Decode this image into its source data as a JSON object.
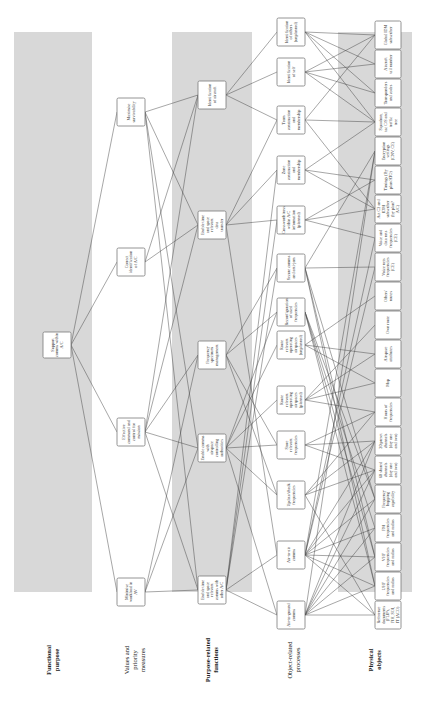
{
  "diagram": {
    "orientation": "rotated 90 degrees counter-clockwise",
    "layers": [
      {
        "id": "fp",
        "label": "Functional purpose",
        "bold": true,
        "shaded": true
      },
      {
        "id": "vpm",
        "label": "Values and priority measures",
        "bold": false,
        "shaded": false
      },
      {
        "id": "prf",
        "label": "Purpose-related functions",
        "bold": true,
        "shaded": true
      },
      {
        "id": "orp",
        "label": "Object-related processes",
        "bold": false,
        "shaded": false
      },
      {
        "id": "po",
        "label": "Physical objects",
        "bold": true,
        "shaded": true
      }
    ],
    "nodes": {
      "fp": [
        {
          "id": "fp1",
          "label": "Support comms within A/C"
        }
      ],
      "vpm": [
        {
          "id": "v1",
          "label": "Minimise workload in AV"
        },
        {
          "id": "v2",
          "label": "Effective command and control for mission"
        },
        {
          "id": "v3",
          "label": "Correct identification of A/C"
        },
        {
          "id": "v4",
          "label": "Maximise survivability"
        }
      ],
      "prf": [
        {
          "id": "p1",
          "label": "Enable time and space relevant comms with other A/C"
        },
        {
          "id": "p2",
          "label": "Enable comms with airspace controlling authorities"
        },
        {
          "id": "p3",
          "label": "Frequency spectrum management"
        },
        {
          "id": "p4",
          "label": "Enable time and space relevant data transfer"
        },
        {
          "id": "p5",
          "label": "Identification of aircraft"
        }
      ],
      "orp": [
        {
          "id": "o1",
          "label": "Air-to-ground comms"
        },
        {
          "id": "o2",
          "label": "Air-to-air comms"
        },
        {
          "id": "o3",
          "label": "Update/check frequencies"
        },
        {
          "id": "o4",
          "label": "Store relevant frequencies"
        },
        {
          "id": "o5",
          "label": "Route relevant operating airspaces (planned)"
        },
        {
          "id": "o6",
          "label": "Route relevant operating airspaces (unplanned)"
        },
        {
          "id": "o7",
          "label": "Reconfiguration of used frequencies"
        },
        {
          "id": "o8",
          "label": "Secure comms and anti-jam"
        },
        {
          "id": "o9",
          "label": "Crossworthiness within A/C information (planned)"
        },
        {
          "id": "o10",
          "label": "Zone construction and membership"
        },
        {
          "id": "o11",
          "label": "Team construction and membership"
        },
        {
          "id": "o12",
          "label": "Identification of self"
        },
        {
          "id": "o13",
          "label": "Identification of others (unplanned)"
        }
      ],
      "po": [
        {
          "id": "x1",
          "label": "Reference documents (FLIPs, FIH, SOI, IT (ACO)"
        },
        {
          "id": "x2",
          "label": "UHF frequencies and radios"
        },
        {
          "id": "x3",
          "label": "VHF frequencies and radios"
        },
        {
          "id": "x4",
          "label": "FM frequencies and radios"
        },
        {
          "id": "x5",
          "label": "Frequency hopping capability"
        },
        {
          "id": "x6",
          "label": "60 shared channels (day one and two)"
        },
        {
          "id": "x7",
          "label": "20 preset channels (day one and two)"
        },
        {
          "id": "x8",
          "label": "Hours of frequencies"
        },
        {
          "id": "x9",
          "label": "Map"
        },
        {
          "id": "x10",
          "label": "Airspace attributes"
        },
        {
          "id": "x11",
          "label": "Own route"
        },
        {
          "id": "x12",
          "label": "Others' routes"
        },
        {
          "id": "x13",
          "label": "Voice nets frequencies (CE)"
        },
        {
          "id": "x14",
          "label": "Voice and data nets frequencies (CE)"
        },
        {
          "id": "x15",
          "label": "Act C2 and IDM subscriber (by plan? A/C)"
        },
        {
          "id": "x16",
          "label": "Timings (By plan/ATO)"
        },
        {
          "id": "x17",
          "label": "Encryption settings (CNV, CE)"
        },
        {
          "id": "x18",
          "label": "Squadron, tac C/S and traffic tree"
        },
        {
          "id": "x19",
          "label": "Transponders and codes"
        },
        {
          "id": "x20",
          "label": "Aircraft tail number"
        },
        {
          "id": "x21",
          "label": "Global IDM subscriber"
        }
      ]
    },
    "edges": [
      [
        "fp1",
        "v1"
      ],
      [
        "fp1",
        "v2"
      ],
      [
        "fp1",
        "v3"
      ],
      [
        "fp1",
        "v4"
      ],
      [
        "v1",
        "p1"
      ],
      [
        "v1",
        "p2"
      ],
      [
        "v1",
        "p3"
      ],
      [
        "v2",
        "p1"
      ],
      [
        "v2",
        "p2"
      ],
      [
        "v2",
        "p3"
      ],
      [
        "v2",
        "p4"
      ],
      [
        "v2",
        "p5"
      ],
      [
        "v3",
        "p4"
      ],
      [
        "v3",
        "p5"
      ],
      [
        "v4",
        "p1"
      ],
      [
        "v4",
        "p2"
      ],
      [
        "v4",
        "p4"
      ],
      [
        "v4",
        "p5"
      ],
      [
        "p1",
        "o1"
      ],
      [
        "p1",
        "o2"
      ],
      [
        "p1",
        "o8"
      ],
      [
        "p1",
        "o9"
      ],
      [
        "p1",
        "o10"
      ],
      [
        "p2",
        "o1"
      ],
      [
        "p2",
        "o3"
      ],
      [
        "p2",
        "o4"
      ],
      [
        "p2",
        "o5"
      ],
      [
        "p2",
        "o6"
      ],
      [
        "p2",
        "o7"
      ],
      [
        "p3",
        "o3"
      ],
      [
        "p3",
        "o4"
      ],
      [
        "p3",
        "o7"
      ],
      [
        "p3",
        "o8"
      ],
      [
        "p4",
        "o2"
      ],
      [
        "p4",
        "o9"
      ],
      [
        "p4",
        "o10"
      ],
      [
        "p4",
        "o11"
      ],
      [
        "p5",
        "o11"
      ],
      [
        "p5",
        "o12"
      ],
      [
        "p5",
        "o13"
      ],
      [
        "o1",
        "x1"
      ],
      [
        "o1",
        "x2"
      ],
      [
        "o1",
        "x3"
      ],
      [
        "o1",
        "x4"
      ],
      [
        "o1",
        "x5"
      ],
      [
        "o1",
        "x6"
      ],
      [
        "o1",
        "x7"
      ],
      [
        "o1",
        "x17"
      ],
      [
        "o2",
        "x1"
      ],
      [
        "o2",
        "x2"
      ],
      [
        "o2",
        "x3"
      ],
      [
        "o2",
        "x4"
      ],
      [
        "o2",
        "x5"
      ],
      [
        "o2",
        "x6"
      ],
      [
        "o2",
        "x7"
      ],
      [
        "o2",
        "x13"
      ],
      [
        "o2",
        "x14"
      ],
      [
        "o2",
        "x17"
      ],
      [
        "o3",
        "x1"
      ],
      [
        "o3",
        "x6"
      ],
      [
        "o3",
        "x7"
      ],
      [
        "o3",
        "x8"
      ],
      [
        "o4",
        "x6"
      ],
      [
        "o4",
        "x7"
      ],
      [
        "o4",
        "x8"
      ],
      [
        "o5",
        "x8"
      ],
      [
        "o5",
        "x9"
      ],
      [
        "o5",
        "x10"
      ],
      [
        "o5",
        "x11"
      ],
      [
        "o6",
        "x9"
      ],
      [
        "o6",
        "x10"
      ],
      [
        "o6",
        "x12"
      ],
      [
        "o7",
        "x2"
      ],
      [
        "o7",
        "x3"
      ],
      [
        "o7",
        "x4"
      ],
      [
        "o7",
        "x5"
      ],
      [
        "o8",
        "x2"
      ],
      [
        "o8",
        "x3"
      ],
      [
        "o8",
        "x5"
      ],
      [
        "o8",
        "x17"
      ],
      [
        "o8",
        "x13"
      ],
      [
        "o9",
        "x14"
      ],
      [
        "o9",
        "x15"
      ],
      [
        "o9",
        "x16"
      ],
      [
        "o10",
        "x15"
      ],
      [
        "o10",
        "x16"
      ],
      [
        "o10",
        "x18"
      ],
      [
        "o11",
        "x15"
      ],
      [
        "o11",
        "x18"
      ],
      [
        "o11",
        "x21"
      ],
      [
        "o12",
        "x18"
      ],
      [
        "o12",
        "x19"
      ],
      [
        "o12",
        "x20"
      ],
      [
        "o12",
        "x21"
      ],
      [
        "o13",
        "x19"
      ],
      [
        "o13",
        "x20"
      ],
      [
        "o13",
        "x21"
      ],
      [
        "o13",
        "x18"
      ]
    ]
  }
}
